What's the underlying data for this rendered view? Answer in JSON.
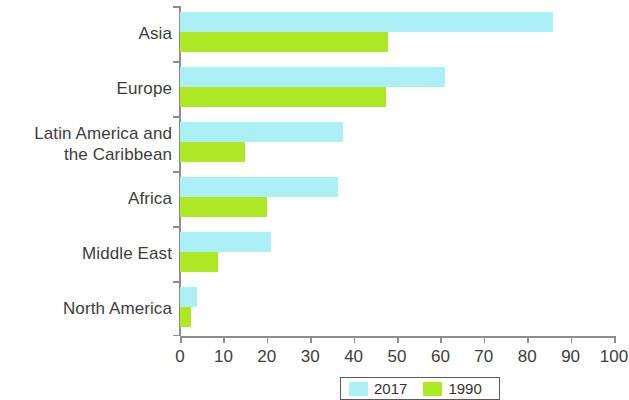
{
  "chart_data": {
    "type": "bar",
    "orientation": "horizontal",
    "title": "",
    "subtitle": "",
    "xlabel": "",
    "ylabel": "",
    "xlim": [
      0,
      100
    ],
    "xticks": [
      0,
      10,
      20,
      30,
      40,
      50,
      60,
      70,
      80,
      90,
      100
    ],
    "xtick_labels": [
      "0",
      "10",
      "20",
      "30",
      "40",
      "50",
      "60",
      "70",
      "80",
      "90",
      "100"
    ],
    "grid": false,
    "legend_position": "bottom",
    "categories": [
      "Asia",
      "Europe",
      "Latin America and\nthe Caribbean",
      "Africa",
      "Middle East",
      "North America"
    ],
    "series": [
      {
        "name": "2017",
        "color": "#abf0f7",
        "values": [
          86,
          61,
          37.5,
          36.5,
          21,
          4
        ]
      },
      {
        "name": "1990",
        "color": "#aee824",
        "values": [
          48,
          47.5,
          15,
          20,
          8.7,
          2.5
        ]
      }
    ]
  },
  "legend": {
    "items": [
      {
        "label": "2017",
        "color": "#abf0f7"
      },
      {
        "label": "1990",
        "color": "#aee824"
      }
    ]
  },
  "colors": {
    "series_2017": "#abf0f7",
    "series_1990": "#aee824",
    "axis": "#8d8d8d",
    "text": "#3d3d3d",
    "background": "#ffffff"
  }
}
